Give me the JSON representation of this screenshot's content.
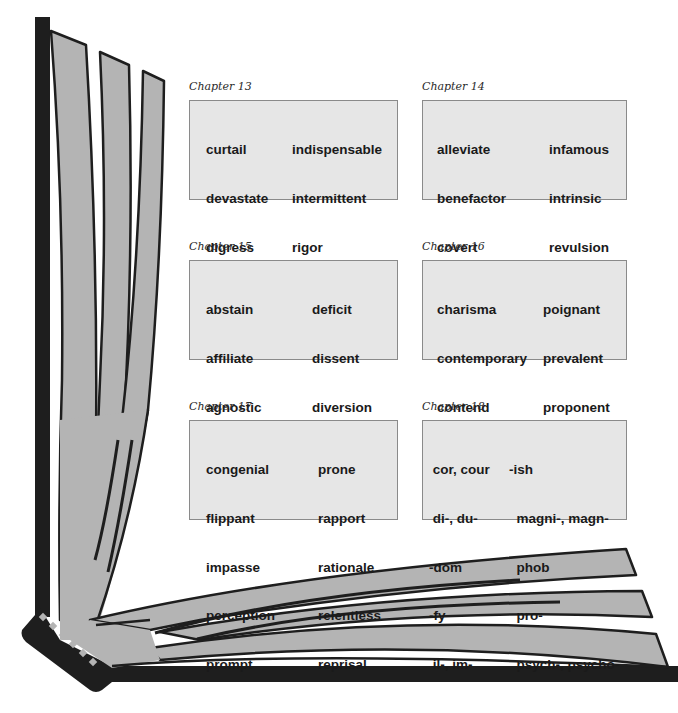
{
  "chapters": [
    {
      "title": "Chapter 13",
      "left_words": [
        "curtail",
        "devastate",
        "digress",
        "incentive",
        "incorporate"
      ],
      "right_words": [
        "indispensable",
        "intermittent",
        "rigor",
        "squander",
        "succumb"
      ]
    },
    {
      "title": "Chapter 14",
      "left_words": [
        "alleviate",
        "benefactor",
        "covert",
        "cynic",
        "demise"
      ],
      "right_words": [
        "infamous",
        "intrinsic",
        "revulsion",
        "speculate",
        "virile"
      ]
    },
    {
      "title": "Chapter 15",
      "left_words": [
        "abstain",
        "affiliate",
        "agnostic",
        "aspire",
        "benevolent"
      ],
      "right_words": [
        "deficit",
        "dissent",
        "diversion",
        "lucrative",
        "mandatory"
      ]
    },
    {
      "title": "Chapter 16",
      "left_words": [
        "charisma",
        "contemporary",
        "contend",
        "conversely",
        "extrovert"
      ],
      "right_words": [
        "poignant",
        "prevalent",
        "proponent",
        "quest",
        "traumatic"
      ]
    },
    {
      "title": "Chapter 17",
      "left_words": [
        "congenial",
        "flippant",
        "impasse",
        "perception",
        "prompt"
      ],
      "right_words": [
        "prone",
        "rapport",
        "rationale",
        "relentless",
        "reprisal"
      ]
    },
    {
      "title": "Chapter 18",
      "left_words": [
        " cor, cour",
        " di-, du-",
        "-dom",
        "-fy",
        " il-, im-"
      ],
      "right_words": [
        "-ish",
        "  magni-, magn-",
        "  phob",
        "  pro-",
        "  psych-, psycho-"
      ]
    }
  ],
  "colors": {
    "spine": "#1e1e1e",
    "page_fill": "#b4b4b4",
    "page_stroke": "#1e1e1e",
    "box_fill": "#e6e6e6",
    "box_border": "#8a8a8a",
    "text": "#1a1a1a"
  }
}
